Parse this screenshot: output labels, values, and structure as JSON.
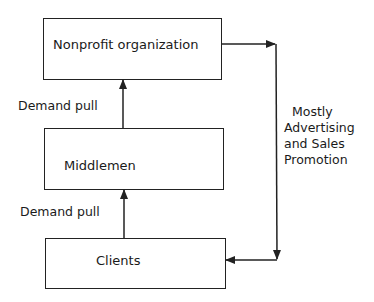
{
  "diagram": {
    "boxes": [
      {
        "id": "nonprofit",
        "label": "Nonprofit organization"
      },
      {
        "id": "middlemen",
        "label": "Middlemen"
      },
      {
        "id": "clients",
        "label": "Clients"
      }
    ],
    "edge_labels": {
      "middlemen_to_nonprofit": "Demand pull",
      "clients_to_middlemen": "Demand pull",
      "push_line": [
        "Mostly",
        "Advertising",
        "and Sales",
        "Promotion"
      ]
    },
    "edges": [
      {
        "from": "clients",
        "to": "middlemen",
        "label": "Demand pull"
      },
      {
        "from": "middlemen",
        "to": "nonprofit",
        "label": "Demand pull"
      },
      {
        "from": "nonprofit",
        "to": "clients",
        "label": "Mostly Advertising and Sales Promotion"
      }
    ]
  }
}
